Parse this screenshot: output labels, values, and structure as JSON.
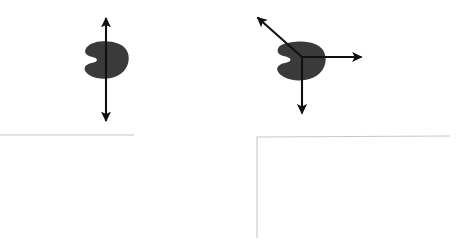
{
  "canvas": {
    "width": 461,
    "height": 241,
    "background": "#ffffff"
  },
  "colors": {
    "blob_fill": "#3a3a3a",
    "arrow_stroke": "#111111",
    "guide_line": "#c8c8c8"
  },
  "figures": [
    {
      "id": "left-figure",
      "name": "single-axis-blob-figure",
      "blob": {
        "name": "kidney-blob-left",
        "center_x": 106,
        "center_y": 60,
        "width": 44,
        "height": 37,
        "notch_side": "left"
      },
      "arrows": [
        {
          "name": "vertical-double-arrow",
          "x1": 106,
          "y1": 122,
          "x2": 106,
          "y2": 17,
          "heads": "both",
          "label": ""
        }
      ]
    },
    {
      "id": "right-figure",
      "name": "three-axis-blob-figure",
      "blob": {
        "name": "kidney-blob-right",
        "center_x": 300,
        "center_y": 61,
        "width": 50,
        "height": 38,
        "notch_side": "left"
      },
      "origin": {
        "x": 302,
        "y": 57
      },
      "arrows": [
        {
          "name": "diagonal-up-left-arrow",
          "x1": 302,
          "y1": 57,
          "x2": 256,
          "y2": 16,
          "heads": "end",
          "label": ""
        },
        {
          "name": "horizontal-right-arrow",
          "x1": 302,
          "y1": 57,
          "x2": 363,
          "y2": 57,
          "heads": "end",
          "label": ""
        },
        {
          "name": "vertical-down-arrow",
          "x1": 302,
          "y1": 57,
          "x2": 302,
          "y2": 115,
          "heads": "end",
          "label": ""
        }
      ]
    }
  ],
  "guides": [
    {
      "name": "left-horizontal-guide",
      "points": "0,135 134,135"
    },
    {
      "name": "right-corner-guide",
      "points": "450,136 257,137 257,238"
    }
  ]
}
